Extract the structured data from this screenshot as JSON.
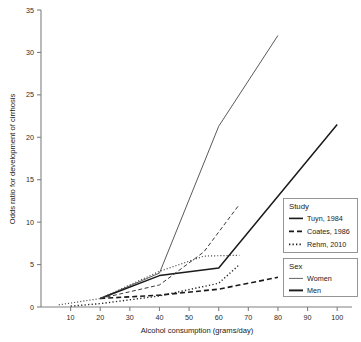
{
  "chart_data": {
    "type": "line",
    "title": "",
    "xlabel": "Alcohol consumption  (grams/day)",
    "ylabel": "Odds ratio for development of cirrhosis",
    "xlim": [
      0,
      105
    ],
    "ylim": [
      0,
      35
    ],
    "xticks": [
      10,
      20,
      30,
      40,
      50,
      60,
      70,
      80,
      90,
      100
    ],
    "yticks": [
      0,
      5,
      10,
      15,
      20,
      25,
      30,
      35
    ],
    "grid": false,
    "legend_position": "right",
    "series": [
      {
        "name": "Tuyn, 1984 — Women",
        "study": "Tuyn, 1984",
        "sex": "Women",
        "style": "solid",
        "color": "#5a5a5a",
        "width": 1.0,
        "x": [
          20,
          40,
          60,
          80
        ],
        "y": [
          1.0,
          4.0,
          21.3,
          32.0
        ]
      },
      {
        "name": "Tuyn, 1984 — Men",
        "study": "Tuyn, 1984",
        "sex": "Men",
        "style": "solid",
        "color": "#1a1a1a",
        "width": 1.5,
        "x": [
          20,
          40,
          60,
          100
        ],
        "y": [
          1.0,
          3.7,
          4.6,
          21.5
        ]
      },
      {
        "name": "Coates, 1986 — Women",
        "study": "Coates, 1986",
        "sex": "Women",
        "style": "dashed",
        "color": "#1a1a1a",
        "width": 1.6,
        "x": [
          20,
          40,
          60,
          80
        ],
        "y": [
          1.0,
          1.4,
          2.1,
          3.5
        ]
      },
      {
        "name": "Coates, 1986 — Men",
        "study": "Coates, 1986",
        "sex": "Men",
        "style": "dashed",
        "color": "#3a3a3a",
        "width": 1.0,
        "x": [
          20,
          40,
          55,
          67
        ],
        "y": [
          1.0,
          2.6,
          6.5,
          12.1
        ]
      },
      {
        "name": "Rehm, 2010 — Women",
        "study": "Rehm, 2010",
        "sex": "Women",
        "style": "dotted",
        "color": "#4a4a4a",
        "width": 1.2,
        "x": [
          6,
          20,
          40,
          55,
          67
        ],
        "y": [
          0.25,
          1.0,
          4.2,
          6.0,
          6.1
        ]
      },
      {
        "name": "Rehm, 2010 — Men",
        "study": "Rehm, 2010",
        "sex": "Men",
        "style": "dotted",
        "color": "#2a2a2a",
        "width": 1.4,
        "x": [
          10,
          20,
          40,
          60,
          67
        ],
        "y": [
          0.1,
          0.4,
          1.3,
          2.8,
          5.0
        ]
      }
    ]
  },
  "legend": {
    "study": {
      "title": "Study",
      "items": [
        {
          "label": "Tuyn, 1984",
          "style": "solid"
        },
        {
          "label": "Coates, 1986",
          "style": "dashed"
        },
        {
          "label": "Rehm, 2010",
          "style": "dotted"
        }
      ]
    },
    "sex": {
      "title": "Sex",
      "items": [
        {
          "label": "Women",
          "width": "thin"
        },
        {
          "label": "Men",
          "width": "thick"
        }
      ]
    }
  },
  "colors": {
    "axis": "#808080",
    "text": "#1a1a1a",
    "thin_line": "#5a5a5a",
    "thick_line": "#1a1a1a",
    "legend_border": "#8a8a8a",
    "background": "#ffffff"
  }
}
